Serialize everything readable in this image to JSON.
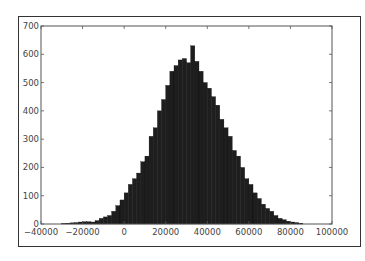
{
  "chart_data": {
    "type": "bar",
    "subtype": "histogram",
    "title": "",
    "xlabel": "",
    "ylabel": "",
    "xlim": [
      -40000,
      100000
    ],
    "ylim": [
      0,
      700
    ],
    "grid": false,
    "legend": null,
    "x_ticks": [
      -40000,
      -20000,
      0,
      20000,
      40000,
      60000,
      80000,
      100000
    ],
    "x_tick_labels": [
      "−40000",
      "−20000",
      "0",
      "20000",
      "40000",
      "60000",
      "80000",
      "100000"
    ],
    "y_ticks": [
      0,
      100,
      200,
      300,
      400,
      500,
      600,
      700
    ],
    "y_tick_labels": [
      "0",
      "100",
      "200",
      "300",
      "400",
      "500",
      "600",
      "700"
    ],
    "bin_width": 2000,
    "bin_start": -30000,
    "bar_color": "#1e1e1e",
    "values": [
      2,
      3,
      4,
      5,
      7,
      8,
      8,
      7,
      12,
      20,
      25,
      30,
      45,
      65,
      85,
      110,
      140,
      160,
      180,
      220,
      240,
      310,
      340,
      400,
      440,
      490,
      540,
      560,
      580,
      585,
      570,
      630,
      575,
      540,
      500,
      480,
      450,
      420,
      370,
      340,
      310,
      260,
      240,
      200,
      160,
      140,
      110,
      90,
      70,
      55,
      45,
      30,
      20,
      15,
      10,
      7,
      5,
      3
    ]
  }
}
